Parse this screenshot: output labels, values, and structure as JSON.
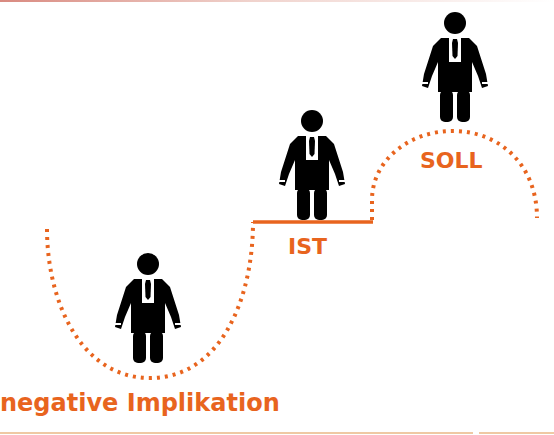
{
  "colors": {
    "accent": "#E8641E",
    "figure": "#000000",
    "background": "#FFFFFF",
    "bottom_rule": "#EFC9A4"
  },
  "labels": {
    "current_state": "IST",
    "target_state": "SOLL",
    "negative_implication": "negative Implikation"
  },
  "figures": [
    {
      "id": "figure-negative",
      "icon": "businessman-icon",
      "position": "bottom-of-valley"
    },
    {
      "id": "figure-ist",
      "icon": "businessman-icon",
      "position": "on-ist-plateau"
    },
    {
      "id": "figure-soll",
      "icon": "businessman-icon",
      "position": "on-soll-peak"
    }
  ],
  "paths": [
    {
      "id": "valley-curve",
      "style": "dotted",
      "meaning": "negative implication dip"
    },
    {
      "id": "ist-plateau",
      "style": "solid",
      "meaning": "current state level"
    },
    {
      "id": "soll-arch",
      "style": "dotted",
      "meaning": "target state peak"
    }
  ]
}
